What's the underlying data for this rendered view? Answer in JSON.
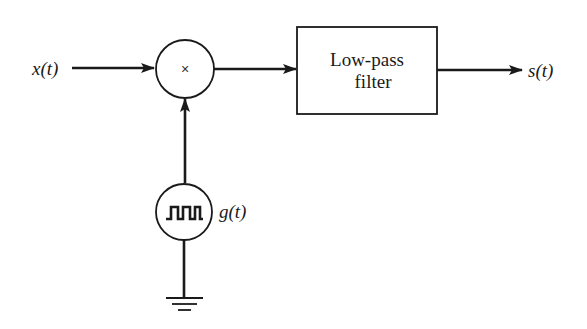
{
  "diagram": {
    "type": "block-diagram",
    "input": {
      "label": "x(t)"
    },
    "multiplier": {
      "symbol": "×"
    },
    "generator": {
      "label": "g(t)",
      "waveform": "square-pulse-train"
    },
    "filter": {
      "line1": "Low-pass",
      "line2": "filter"
    },
    "output": {
      "label": "s(t)"
    },
    "ground": {
      "symbol": "ground"
    },
    "colors": {
      "stroke": "#1a1a1a",
      "background": "#ffffff"
    }
  }
}
